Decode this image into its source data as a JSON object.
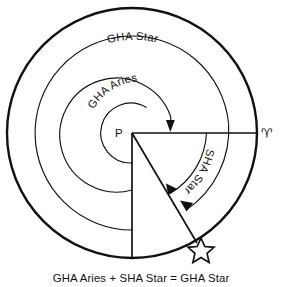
{
  "diagram": {
    "title": "GHA Aries + SHA Star = GHA Star",
    "caption": "GHA Aries + SHA Star = GHA Star",
    "labels": {
      "outer_arc": "GHA  Star",
      "inner_arc": "GHA Aries",
      "middle_arc": "SHA Star",
      "pole": "P",
      "aries_point": "♈",
      "star_symbol": "star-outline"
    },
    "colors": {
      "ink": "#111111",
      "background": "#ffffff"
    },
    "geometry": {
      "center_x": 132,
      "center_y": 133,
      "outer_radius": 125,
      "arc2_radius": 97,
      "arc3_radius": 57,
      "arc4_radius": 30,
      "aries_direction_deg": 0,
      "star_direction_deg": -62
    },
    "elements": [
      {
        "name": "outer-circle",
        "kind": "circle"
      },
      {
        "name": "gha-star-arc",
        "kind": "arc"
      },
      {
        "name": "sha-star-arc",
        "kind": "arc"
      },
      {
        "name": "gha-aries-arc",
        "kind": "arc"
      },
      {
        "name": "pole-point",
        "kind": "point"
      },
      {
        "name": "aries-ray",
        "kind": "line"
      },
      {
        "name": "star-ray",
        "kind": "line"
      },
      {
        "name": "meridian-ray",
        "kind": "line"
      }
    ]
  }
}
